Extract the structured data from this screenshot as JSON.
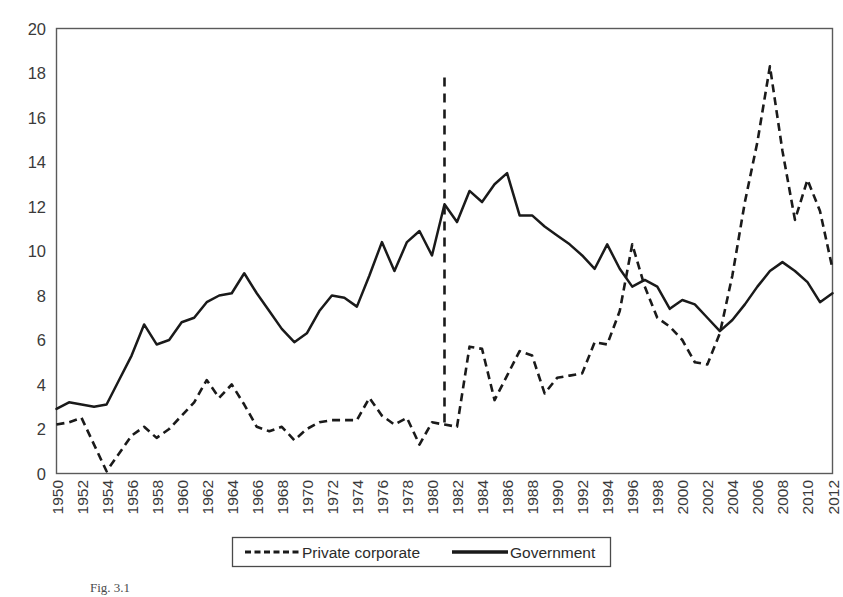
{
  "chart_data": {
    "type": "line",
    "title": "",
    "subtitle": "",
    "xlabel": "",
    "ylabel": "",
    "ylim": [
      0,
      20
    ],
    "ytick_step": 2,
    "ytick_labels": [
      "0",
      "2",
      "4",
      "6",
      "8",
      "10",
      "12",
      "14",
      "16",
      "18",
      "20"
    ],
    "grid": false,
    "legend_position": "bottom-center",
    "x": [
      1950,
      1951,
      1952,
      1953,
      1954,
      1955,
      1956,
      1957,
      1958,
      1959,
      1960,
      1961,
      1962,
      1963,
      1964,
      1965,
      1966,
      1967,
      1968,
      1969,
      1970,
      1971,
      1972,
      1973,
      1974,
      1975,
      1976,
      1977,
      1978,
      1979,
      1980,
      1981,
      1982,
      1983,
      1984,
      1985,
      1986,
      1987,
      1988,
      1989,
      1990,
      1991,
      1992,
      1993,
      1994,
      1995,
      1996,
      1997,
      1998,
      1999,
      2000,
      2001,
      2002,
      2003,
      2004,
      2005,
      2006,
      2007,
      2008,
      2009,
      2010,
      2011,
      2012
    ],
    "xtick_labels": [
      "1950",
      "1952",
      "1954",
      "1956",
      "1958",
      "1960",
      "1962",
      "1964",
      "1966",
      "1968",
      "1970",
      "1972",
      "1974",
      "1976",
      "1978",
      "1980",
      "1982",
      "1984",
      "1986",
      "1988",
      "1990",
      "1992",
      "1994",
      "1996",
      "1998",
      "2000",
      "2002",
      "2004",
      "2006",
      "2008",
      "2010",
      "2012"
    ],
    "xtick_step": 2,
    "series": [
      {
        "name": "Private corporate",
        "style": "dashed",
        "color": "#1a1a1a",
        "values": [
          2.2,
          2.3,
          2.5,
          1.3,
          0.1,
          0.9,
          1.7,
          2.1,
          1.6,
          2.0,
          2.6,
          3.2,
          4.2,
          3.4,
          4.0,
          3.1,
          2.1,
          1.9,
          2.1,
          1.5,
          2.0,
          2.3,
          2.4,
          2.4,
          2.4,
          3.4,
          2.6,
          2.2,
          2.5,
          1.3,
          2.3,
          2.2,
          2.1,
          5.7,
          5.6,
          3.3,
          4.4,
          5.5,
          5.3,
          3.6,
          4.3,
          4.4,
          4.5,
          5.9,
          5.8,
          7.3,
          10.3,
          8.4,
          7.0,
          6.6,
          6.0,
          5.0,
          4.9,
          6.3,
          8.9,
          12.2,
          14.9,
          18.3,
          14.5,
          11.4,
          13.2,
          11.8,
          9.2
        ]
      },
      {
        "name": "Government",
        "style": "solid",
        "color": "#1a1a1a",
        "values": [
          2.9,
          3.2,
          3.1,
          3.0,
          3.1,
          4.2,
          5.3,
          6.7,
          5.8,
          6.0,
          6.8,
          7.0,
          7.7,
          8.0,
          8.1,
          9.0,
          8.1,
          7.3,
          6.5,
          5.9,
          6.3,
          7.3,
          8.0,
          7.9,
          7.5,
          8.9,
          10.4,
          9.1,
          10.4,
          10.9,
          9.8,
          12.1,
          11.3,
          12.7,
          12.2,
          13.0,
          13.5,
          11.6,
          11.6,
          11.1,
          10.7,
          10.3,
          9.8,
          9.2,
          10.3,
          9.2,
          8.4,
          8.7,
          8.4,
          7.4,
          7.8,
          7.6,
          7.0,
          6.4,
          6.9,
          7.6,
          8.4,
          9.1,
          9.5,
          9.1,
          8.6,
          7.7,
          8.1
        ]
      }
    ],
    "annotations": [
      {
        "name": "structural-break-line",
        "type": "vertical-line",
        "x": 1981,
        "y_from": 2.0,
        "y_to": 17.8,
        "style": "dashed"
      }
    ]
  },
  "legend": {
    "entries": [
      {
        "label": "Private corporate",
        "style": "dashed"
      },
      {
        "label": "Government",
        "style": "solid"
      }
    ]
  },
  "caption": {
    "text": "Fig. 3.1"
  }
}
